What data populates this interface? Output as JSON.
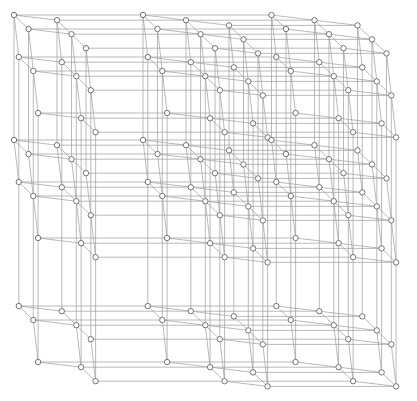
{
  "canvas": {
    "width": 417,
    "height": 401,
    "background": "#ffffff"
  },
  "graph": {
    "type": "lattice-graph",
    "block_cols_x": [
      14,
      143,
      271.5
    ],
    "block_rows_y": [
      15,
      140,
      264
    ],
    "cell_dims": {
      "i": 3,
      "j": 3,
      "k": 3
    },
    "step_i": [
      43,
      5.2
    ],
    "step_j": [
      4.8,
      42
    ],
    "step_k": [
      14.5,
      14
    ],
    "absent_rules": [
      {
        "i": 0,
        "k": 2
      },
      {
        "j": 2,
        "k": 0
      },
      {
        "bi": 0,
        "i": 2
      },
      {
        "bj": 2,
        "j": 0
      }
    ],
    "edge_rules": [
      "in-block neighbor along i",
      "in-block neighbor along j",
      "in-block neighbor along k",
      "same cell in next block column",
      "same cell in next block row"
    ],
    "style": {
      "edge_color": "#9c9c9c",
      "edge_width": 0.7,
      "node_fill": "#ffffff",
      "node_stroke": "#666666",
      "node_stroke_width": 0.9,
      "node_radius": 2.7
    }
  }
}
